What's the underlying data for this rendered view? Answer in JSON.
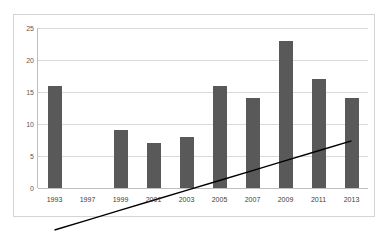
{
  "chart_data": {
    "type": "bar",
    "title": "",
    "subtitle": "",
    "xlabel": "",
    "ylabel": "",
    "categories": [
      "1993",
      "1997",
      "1999",
      "2001",
      "2003",
      "2005",
      "2007",
      "2009",
      "2011",
      "2013"
    ],
    "series": [
      {
        "name": "Count",
        "type": "bar",
        "values": [
          16,
          null,
          9,
          7,
          8,
          16,
          14,
          23,
          17,
          14
        ]
      },
      {
        "name": "Linear trendline",
        "type": "line",
        "values": [
          9.7,
          10.45,
          11.2,
          11.95,
          12.7,
          13.45,
          14.2,
          14.95,
          15.7,
          16.45
        ]
      }
    ],
    "ylim": [
      0,
      25
    ],
    "yticks": [
      0,
      5,
      10,
      15,
      20,
      25
    ],
    "ytick_labels": [
      "0",
      "5",
      "10",
      "15",
      "20",
      "25"
    ],
    "grid": {
      "horizontal": true,
      "vertical": false
    },
    "legend": {
      "visible": false,
      "position": "none"
    },
    "colors": {
      "bar": "#595959",
      "trendline": "#000000",
      "gridline": "#d9d9d9",
      "axis": "#bfbfbf",
      "plot_background": "#ffffff",
      "frame_border": "#d4d4d4",
      "tick_label": "#595959",
      "category_label": "#404040"
    },
    "notes": {
      "missing_category": "1997",
      "missing_category_note": "no bar drawn at 1997"
    }
  }
}
